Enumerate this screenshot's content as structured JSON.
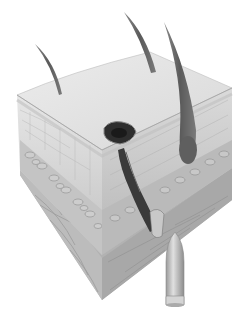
{
  "illustration": {
    "subject": "skin cross-section with bullet wound track",
    "elements": [
      "skin-block",
      "hair-left",
      "hair-middle",
      "hair-right-large",
      "entry-wound",
      "wound-track",
      "bullet"
    ]
  },
  "colors": {
    "background": "#ffffff",
    "skin_top": "#e4e4e4",
    "skin_front": "#d6d6d6",
    "skin_side": "#c9c9c9",
    "fat_layer": "#bdbdbd",
    "muscle": "#a9a9a9",
    "hair": "#6e6e6e",
    "wound": "#2e2e2e",
    "bullet": "#b4b4b4"
  }
}
